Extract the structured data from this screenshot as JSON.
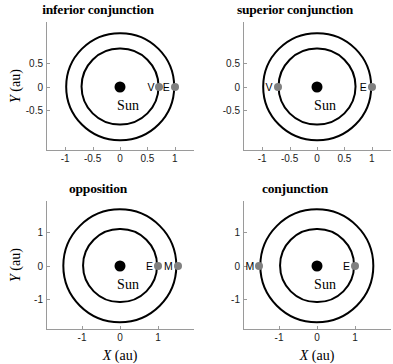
{
  "chart_data": [
    {
      "type": "scatter",
      "id": "inferior-conjunction",
      "title": "inferior conjunction",
      "xlabel": "X (au)",
      "ylabel": "Y (au)",
      "show_xlabel": false,
      "show_ylabel": true,
      "xlim": [
        -1.35,
        1.35
      ],
      "ylim": [
        -1.35,
        1.35
      ],
      "xticks": [
        -1,
        -0.5,
        0,
        0.5,
        1
      ],
      "xticklabels": [
        "-1",
        "-0.5",
        "0",
        "0.5",
        "1"
      ],
      "yticks": [
        0.5,
        0,
        -0.5
      ],
      "yticklabels": [
        "0.5",
        "0",
        "-0.5"
      ],
      "grid": false,
      "legend": "none",
      "sun": {
        "label": "Sun",
        "x": 0,
        "y": 0,
        "color": "#000000"
      },
      "orbits": [
        {
          "name": "Venus orbit",
          "radius_au": 0.72
        },
        {
          "name": "Earth orbit",
          "radius_au": 1.0
        }
      ],
      "markers": [
        {
          "label": "V",
          "body": "Venus",
          "x": 0.72,
          "y": 0,
          "color": "#808080"
        },
        {
          "label": "E",
          "body": "Earth",
          "x": 1.0,
          "y": 0,
          "color": "#808080"
        }
      ]
    },
    {
      "type": "scatter",
      "id": "superior-conjunction",
      "title": "superior conjunction",
      "xlabel": "X (au)",
      "ylabel": "Y (au)",
      "show_xlabel": false,
      "show_ylabel": false,
      "xlim": [
        -1.35,
        1.35
      ],
      "ylim": [
        -1.35,
        1.35
      ],
      "xticks": [
        -1,
        -0.5,
        0,
        0.5,
        1
      ],
      "xticklabels": [
        "-1",
        "-0.5",
        "0",
        "0.5",
        "1"
      ],
      "yticks": [
        0.5,
        0,
        -0.5
      ],
      "yticklabels": [
        "0.5",
        "0",
        "-0.5"
      ],
      "grid": false,
      "legend": "none",
      "sun": {
        "label": "Sun",
        "x": 0,
        "y": 0,
        "color": "#000000"
      },
      "orbits": [
        {
          "name": "Venus orbit",
          "radius_au": 0.72
        },
        {
          "name": "Earth orbit",
          "radius_au": 1.0
        }
      ],
      "markers": [
        {
          "label": "V",
          "body": "Venus",
          "x": -0.72,
          "y": 0,
          "color": "#808080"
        },
        {
          "label": "E",
          "body": "Earth",
          "x": 1.0,
          "y": 0,
          "color": "#808080"
        }
      ]
    },
    {
      "type": "scatter",
      "id": "opposition",
      "title": "opposition",
      "xlabel": "X (au)",
      "ylabel": "Y (au)",
      "show_xlabel": true,
      "show_ylabel": true,
      "xlim": [
        -1.95,
        1.95
      ],
      "ylim": [
        -1.95,
        1.95
      ],
      "xticks": [
        -1,
        0,
        1
      ],
      "xticklabels": [
        "-1",
        "0",
        "1"
      ],
      "yticks": [
        1,
        0,
        -1
      ],
      "yticklabels": [
        "1",
        "0",
        "-1"
      ],
      "grid": false,
      "legend": "none",
      "sun": {
        "label": "Sun",
        "x": 0,
        "y": 0,
        "color": "#000000"
      },
      "orbits": [
        {
          "name": "Earth orbit",
          "radius_au": 1.0
        },
        {
          "name": "Mars orbit",
          "radius_au": 1.52
        }
      ],
      "markers": [
        {
          "label": "E",
          "body": "Earth",
          "x": 1.0,
          "y": 0,
          "color": "#808080"
        },
        {
          "label": "M",
          "body": "Mars",
          "x": 1.52,
          "y": 0,
          "color": "#808080"
        }
      ]
    },
    {
      "type": "scatter",
      "id": "conjunction",
      "title": "conjunction",
      "xlabel": "X (au)",
      "ylabel": "Y (au)",
      "show_xlabel": true,
      "show_ylabel": false,
      "xlim": [
        -1.95,
        1.95
      ],
      "ylim": [
        -1.95,
        1.95
      ],
      "xticks": [
        -1,
        0,
        1
      ],
      "xticklabels": [
        "-1",
        "0",
        "1"
      ],
      "yticks": [
        1,
        0,
        -1
      ],
      "yticklabels": [
        "1",
        "0",
        "-1"
      ],
      "grid": false,
      "legend": "none",
      "sun": {
        "label": "Sun",
        "x": 0,
        "y": 0,
        "color": "#000000"
      },
      "orbits": [
        {
          "name": "Earth orbit",
          "radius_au": 1.0
        },
        {
          "name": "Mars orbit",
          "radius_au": 1.52
        }
      ],
      "markers": [
        {
          "label": "M",
          "body": "Mars",
          "x": -1.52,
          "y": 0,
          "color": "#808080"
        },
        {
          "label": "E",
          "body": "Earth",
          "x": 1.0,
          "y": 0,
          "color": "#808080"
        }
      ]
    }
  ],
  "axis_label_parts": {
    "x_var": "X",
    "y_var": "Y",
    "unit": " (au)"
  }
}
